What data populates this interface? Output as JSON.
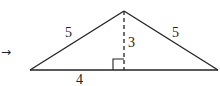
{
  "diagram": {
    "arrow_glyph": "→",
    "labels": {
      "left_side": "5",
      "right_side": "5",
      "height": "3",
      "half_base": "4"
    },
    "colors": {
      "stroke": "#222222",
      "background": "#ffffff"
    },
    "shape": "isosceles triangle with dashed altitude and right-angle marker"
  }
}
